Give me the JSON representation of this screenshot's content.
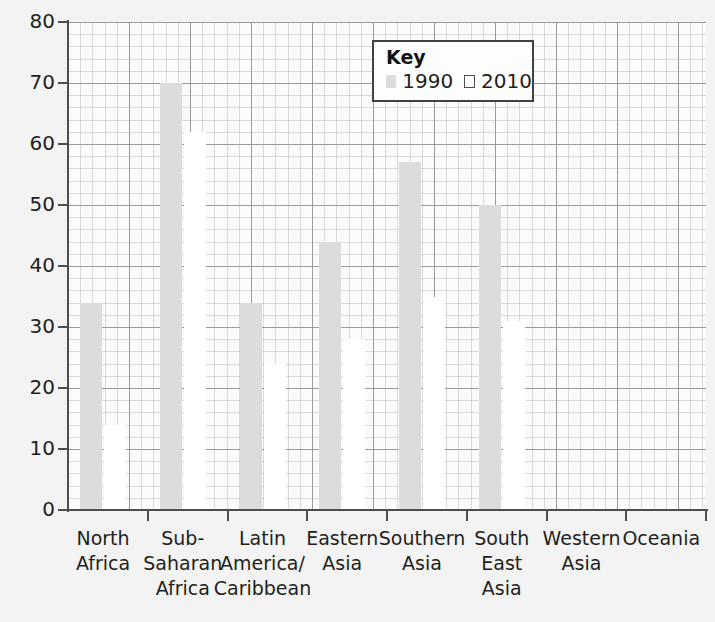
{
  "chart_data": {
    "type": "bar",
    "title": "",
    "xlabel": "",
    "ylabel": "",
    "ylim": [
      0,
      80
    ],
    "yticks": [
      0,
      10,
      20,
      30,
      40,
      50,
      60,
      70,
      80
    ],
    "grid": "graph-paper: major gridlines every 10 units, minor gridlines every 2 units",
    "legend": {
      "title": "Key",
      "position": "upper-center-right",
      "entries": [
        {
          "name": "1990",
          "swatch": "grey-filled"
        },
        {
          "name": "2010",
          "swatch": "white-outlined"
        }
      ]
    },
    "categories": [
      "North\nAfrica",
      "Sub-\nSaharan\nAfrica",
      "Latin\nAmerica/\nCaribbean",
      "Eastern\nAsia",
      "Southern\nAsia",
      "South\nEast\nAsia",
      "Western\nAsia",
      "Oceania"
    ],
    "series": [
      {
        "name": "1990",
        "color": "#dcdcdc",
        "values": [
          34,
          70,
          34,
          44,
          57,
          50,
          0,
          0
        ]
      },
      {
        "name": "2010",
        "color": "#ffffff",
        "values": [
          14,
          62,
          24,
          28,
          35,
          31,
          0,
          0
        ]
      }
    ]
  },
  "axis": {
    "y_tick_labels": [
      "0",
      "10",
      "20",
      "30",
      "40",
      "50",
      "60",
      "70",
      "80"
    ]
  },
  "legend": {
    "title": "Key",
    "item_1990": "1990",
    "item_2010": "2010"
  },
  "colors": {
    "bar_1990": "#dcdcdc",
    "bar_2010": "#ffffff",
    "axis": "#4c4f50",
    "gridline_major": "#82888c",
    "gridline_minor": "#969ea2",
    "background": "#f2f3f2",
    "plot_background": "#fbfbfb",
    "text": "#231f20"
  }
}
